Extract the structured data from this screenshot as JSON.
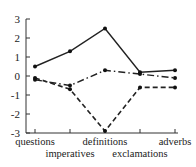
{
  "chart_data": {
    "type": "line",
    "title": "",
    "xlabel": "",
    "ylabel": "",
    "categories": [
      "questions",
      "imperatives",
      "definitions",
      "exclamations",
      "adverbs"
    ],
    "ylim": [
      -3,
      3
    ],
    "yticks": [
      "3",
      "2",
      "1",
      "0",
      "-1",
      "-2",
      "-3"
    ],
    "grid": false,
    "legend": null,
    "series": [
      {
        "name": "solid",
        "style": "solid",
        "values": [
          0.5,
          1.3,
          2.5,
          0.2,
          0.3
        ]
      },
      {
        "name": "dash-dot",
        "style": "dashdot",
        "values": [
          -0.2,
          -0.5,
          0.3,
          0.1,
          -0.1
        ]
      },
      {
        "name": "dashed",
        "style": "dashed",
        "values": [
          -0.1,
          -0.7,
          -2.9,
          -0.6,
          -0.6
        ]
      }
    ]
  }
}
